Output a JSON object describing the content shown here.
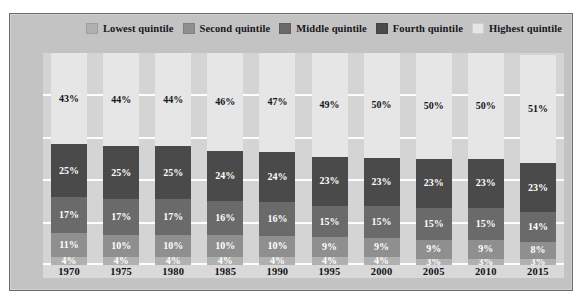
{
  "legend": {
    "items": [
      {
        "label": "Lowest quintile",
        "color": "#b0b0b0",
        "icon": "legend-swatch-icon"
      },
      {
        "label": "Second quintile",
        "color": "#8f8f8f",
        "icon": "legend-swatch-icon"
      },
      {
        "label": "Middle quintile",
        "color": "#6a6a6a",
        "icon": "legend-swatch-icon"
      },
      {
        "label": "Fourth quintile",
        "color": "#4a4a4a",
        "icon": "legend-swatch-icon"
      },
      {
        "label": "Highest quintile",
        "color": "#e6e6e6",
        "icon": "legend-swatch-icon"
      }
    ]
  },
  "chart_data": {
    "type": "bar",
    "stacked": true,
    "title": "",
    "xlabel": "",
    "ylabel": "",
    "ylim": [
      0,
      100
    ],
    "yticks": [
      0,
      20,
      40,
      60,
      80,
      100
    ],
    "ytick_labels": [
      "0",
      "20",
      "40",
      "60",
      "80",
      "100"
    ],
    "grid": true,
    "legend_position": "top-right",
    "categories": [
      "1970",
      "1975",
      "1980",
      "1985",
      "1990",
      "1995",
      "2000",
      "2005",
      "2010",
      "2015"
    ],
    "series": [
      {
        "name": "Lowest quintile",
        "color": "#b0b0b0",
        "values": [
          4,
          4,
          4,
          4,
          4,
          4,
          4,
          3,
          3,
          3
        ],
        "labels": [
          "4%",
          "4%",
          "4%",
          "4%",
          "4%",
          "4%",
          "4%",
          "3%",
          "3%",
          "3%"
        ],
        "label_color": "#ffffff"
      },
      {
        "name": "Second quintile",
        "color": "#8f8f8f",
        "values": [
          11,
          10,
          10,
          10,
          10,
          9,
          9,
          9,
          9,
          8
        ],
        "labels": [
          "11%",
          "10%",
          "10%",
          "10%",
          "10%",
          "9%",
          "9%",
          "9%",
          "9%",
          "8%"
        ],
        "label_color": "#ffffff"
      },
      {
        "name": "Middle quintile",
        "color": "#6a6a6a",
        "values": [
          17,
          17,
          17,
          16,
          16,
          15,
          15,
          15,
          15,
          14
        ],
        "labels": [
          "17%",
          "17%",
          "17%",
          "16%",
          "16%",
          "15%",
          "15%",
          "15%",
          "15%",
          "14%"
        ],
        "label_color": "#ffffff"
      },
      {
        "name": "Fourth quintile",
        "color": "#4a4a4a",
        "values": [
          25,
          25,
          25,
          24,
          24,
          23,
          23,
          23,
          23,
          23
        ],
        "labels": [
          "25%",
          "25%",
          "25%",
          "24%",
          "24%",
          "23%",
          "23%",
          "23%",
          "23%",
          "23%"
        ],
        "label_color": "#ffffff"
      },
      {
        "name": "Highest quintile",
        "color": "#e6e6e6",
        "values": [
          43,
          44,
          44,
          46,
          47,
          49,
          50,
          50,
          50,
          51
        ],
        "labels": [
          "43%",
          "44%",
          "44%",
          "46%",
          "47%",
          "49%",
          "50%",
          "50%",
          "50%",
          "51%"
        ],
        "label_color": "#15151a"
      }
    ]
  }
}
